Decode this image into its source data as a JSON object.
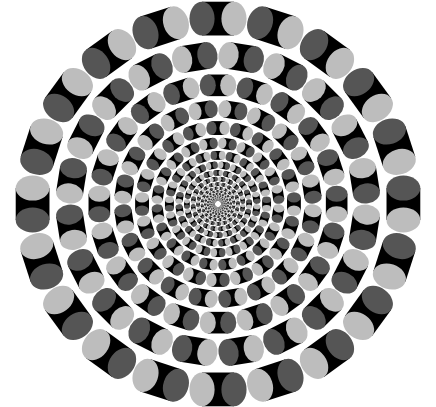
{
  "image": {
    "description": "Rotating-snakes style peripheral drift optical illusion: concentric rings of cylinder segments with light and dark gray elliptical ends on black, on white background",
    "width": 436,
    "height": 407,
    "center": [
      218,
      204
    ],
    "outer_radius": 206,
    "segments_per_ring": 20,
    "colors": {
      "background": "#ffffff",
      "body": "#000000",
      "light_end": "#bdbdbd",
      "dark_end": "#555555",
      "gap": "#ffffff"
    }
  }
}
